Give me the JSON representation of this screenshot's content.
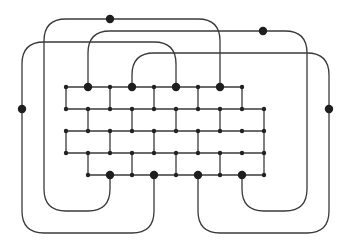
{
  "diagram": {
    "type": "graph",
    "colors": {
      "line": "#3a3a3a",
      "node": "#222222"
    },
    "grid": {
      "columns_x": [
        66,
        88,
        110,
        132,
        154,
        176,
        198,
        220,
        242,
        264
      ],
      "rows_y": [
        87,
        109,
        131,
        153,
        175
      ],
      "horizontal_segments": [
        {
          "row": 0,
          "x1": 66,
          "x2": 242
        },
        {
          "row": 1,
          "x1": 66,
          "x2": 264
        },
        {
          "row": 2,
          "x1": 66,
          "x2": 264
        },
        {
          "row": 3,
          "x1": 66,
          "x2": 264
        },
        {
          "row": 4,
          "x1": 88,
          "x2": 264
        }
      ],
      "vertical_segments": [
        {
          "between_rows": [
            0,
            1
          ],
          "xs": [
            66,
            110,
            154,
            198,
            242
          ]
        },
        {
          "between_rows": [
            1,
            2
          ],
          "xs": [
            88,
            132,
            176,
            220,
            264
          ]
        },
        {
          "between_rows": [
            2,
            3
          ],
          "xs": [
            66,
            110,
            154,
            198,
            264
          ]
        },
        {
          "between_rows": [
            3,
            4
          ],
          "xs": [
            88,
            132,
            176,
            220,
            264
          ]
        }
      ],
      "small_nodes": [
        [
          66,
          87
        ],
        [
          88,
          87
        ],
        [
          110,
          87
        ],
        [
          132,
          87
        ],
        [
          154,
          87
        ],
        [
          176,
          87
        ],
        [
          198,
          87
        ],
        [
          220,
          87
        ],
        [
          242,
          87
        ],
        [
          66,
          109
        ],
        [
          88,
          109
        ],
        [
          110,
          109
        ],
        [
          132,
          109
        ],
        [
          154,
          109
        ],
        [
          176,
          109
        ],
        [
          198,
          109
        ],
        [
          220,
          109
        ],
        [
          242,
          109
        ],
        [
          264,
          109
        ],
        [
          66,
          131
        ],
        [
          88,
          131
        ],
        [
          110,
          131
        ],
        [
          132,
          131
        ],
        [
          154,
          131
        ],
        [
          176,
          131
        ],
        [
          198,
          131
        ],
        [
          220,
          131
        ],
        [
          242,
          131
        ],
        [
          264,
          131
        ],
        [
          66,
          153
        ],
        [
          88,
          153
        ],
        [
          110,
          153
        ],
        [
          132,
          153
        ],
        [
          154,
          153
        ],
        [
          176,
          153
        ],
        [
          198,
          153
        ],
        [
          220,
          153
        ],
        [
          242,
          153
        ],
        [
          264,
          153
        ],
        [
          88,
          175
        ],
        [
          110,
          175
        ],
        [
          132,
          175
        ],
        [
          154,
          175
        ],
        [
          176,
          175
        ],
        [
          198,
          175
        ],
        [
          220,
          175
        ],
        [
          242,
          175
        ],
        [
          264,
          175
        ]
      ]
    },
    "terminals": {
      "top": [
        [
          88,
          87
        ],
        [
          132,
          87
        ],
        [
          176,
          87
        ],
        [
          220,
          87
        ]
      ],
      "bottom": [
        [
          110,
          175
        ],
        [
          154,
          175
        ],
        [
          198,
          175
        ],
        [
          242,
          175
        ]
      ]
    },
    "outer_paths": [
      {
        "id": "path-1",
        "d": "M220 87 L220 41 Q220 19 198 19 L66 19 Q44 19 44 41 L44 189 Q44 211 66 211 L88 211 Q110 211 110 189 L110 175"
      },
      {
        "id": "path-2",
        "d": "M88 87 L88 53 Q88 31 110 31 L285 31 Q307 31 307 53 L307 189 Q307 211 285 211 L264 211 Q242 211 242 189 L242 175"
      },
      {
        "id": "path-3",
        "d": "M176 87 L176 64 Q176 42 154 42 L44 42 Q22 42 22 64 L22 211 Q22 233 44 233 L132 233 Q154 233 154 211 L154 175"
      },
      {
        "id": "path-4",
        "d": "M132 87 L132 75 Q132 53 154 53 L307 53 Q329 53 329 75 L329 211 Q329 233 307 233 L220 233 Q198 233 198 211 L198 175"
      }
    ],
    "path_midpoint_dots": [
      [
        110,
        19
      ],
      [
        263,
        31
      ],
      [
        22,
        109
      ],
      [
        329,
        109
      ]
    ]
  }
}
